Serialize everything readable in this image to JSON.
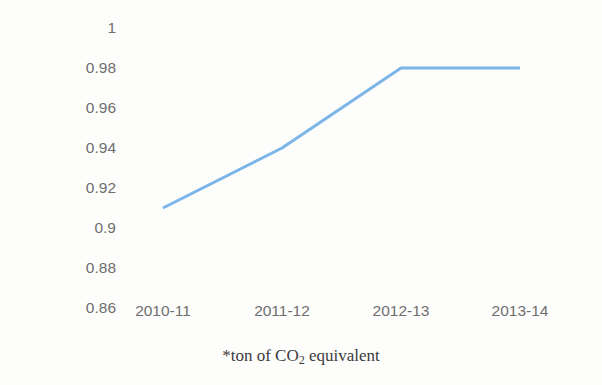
{
  "chart_data": {
    "type": "line",
    "title": "",
    "xlabel": "",
    "ylabel": "tCO2e*/MWh",
    "categories": [
      "2010-11",
      "2011-12",
      "2012-13",
      "2013-14"
    ],
    "values": [
      0.91,
      0.94,
      0.98,
      0.98
    ],
    "series": [
      {
        "name": "Emissions intensity",
        "values": [
          0.91,
          0.94,
          0.98,
          0.98
        ]
      }
    ],
    "ylim": [
      0.86,
      1.0
    ],
    "ytick_step": 0.02,
    "ytick_labels": [
      "1",
      "0.98",
      "0.96",
      "0.94",
      "0.92",
      "0.9",
      "0.88",
      "0.86"
    ],
    "ytick_values": [
      1.0,
      0.98,
      0.96,
      0.94,
      0.92,
      0.9,
      0.88,
      0.86
    ],
    "grid": false,
    "legend": "none",
    "markers": false,
    "line_color": "#7CB5E8",
    "line_width": 3
  },
  "footnote": {
    "prefix": "*ton of CO",
    "subscript": "2",
    "suffix": " equivalent"
  }
}
